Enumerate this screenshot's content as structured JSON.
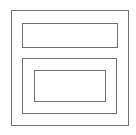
{
  "diagram": {
    "type": "wireframe-nested-rectangles",
    "stroke_color": "#6f6f6f",
    "background_color": "#ffffff",
    "shapes": [
      {
        "name": "outer-frame",
        "x": 11,
        "y": 10,
        "width": 118,
        "height": 116
      },
      {
        "name": "top-bar",
        "x": 22,
        "y": 23,
        "width": 96,
        "height": 25
      },
      {
        "name": "lower-panel",
        "x": 22,
        "y": 58,
        "width": 95,
        "height": 56
      },
      {
        "name": "inner-box",
        "x": 34,
        "y": 70,
        "width": 72,
        "height": 32
      }
    ]
  }
}
